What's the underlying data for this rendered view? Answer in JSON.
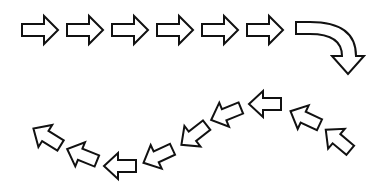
{
  "diagram": {
    "background": "#ffffff",
    "stroke_color": "#111111",
    "top_row": {
      "direction": "right",
      "arrows": [
        {
          "cx": 40,
          "cy": 30,
          "rotate": 0
        },
        {
          "cx": 85,
          "cy": 30,
          "rotate": 0
        },
        {
          "cx": 130,
          "cy": 30,
          "rotate": 0
        },
        {
          "cx": 175,
          "cy": 30,
          "rotate": 0
        },
        {
          "cx": 220,
          "cy": 30,
          "rotate": 0
        },
        {
          "cx": 265,
          "cy": 30,
          "rotate": 0
        }
      ]
    },
    "curved_arrow": {
      "direction": "right-then-down",
      "start_x": 296,
      "top_y": 22,
      "end_x": 348,
      "tip_y": 74
    },
    "bottom_arc": {
      "direction": "left",
      "arrows": [
        {
          "cx": 338,
          "cy": 140,
          "rotate": 40
        },
        {
          "cx": 305,
          "cy": 118,
          "rotate": 25
        },
        {
          "cx": 265,
          "cy": 104,
          "rotate": 0
        },
        {
          "cx": 226,
          "cy": 114,
          "rotate": -22
        },
        {
          "cx": 194,
          "cy": 135,
          "rotate": -38
        },
        {
          "cx": 158,
          "cy": 156,
          "rotate": -25
        },
        {
          "cx": 120,
          "cy": 166,
          "rotate": 0
        },
        {
          "cx": 82,
          "cy": 155,
          "rotate": 22
        },
        {
          "cx": 47,
          "cy": 137,
          "rotate": 32
        }
      ]
    }
  }
}
